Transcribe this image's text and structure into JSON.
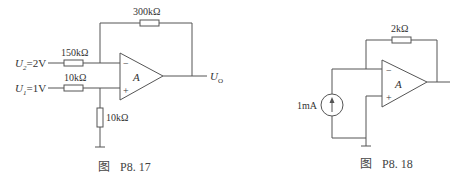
{
  "figures": [
    {
      "caption_prefix": "图",
      "caption_number": "P8. 17",
      "feedback_resistor": "300kΩ",
      "input2": {
        "label_main": "U",
        "label_sub": "2",
        "value": "=2V",
        "resistor": "150kΩ"
      },
      "input1": {
        "label_main": "U",
        "label_sub": "1",
        "value": "=1V",
        "resistor": "10kΩ"
      },
      "ground_resistor": "10kΩ",
      "opamp": {
        "label": "A",
        "minus": "−",
        "plus": "+"
      },
      "output": {
        "label_main": "U",
        "label_sub": "O"
      }
    },
    {
      "caption_prefix": "图",
      "caption_number": "P8. 18",
      "feedback_resistor": "2kΩ",
      "current_source": "1mA",
      "opamp": {
        "label": "A",
        "minus": "−",
        "plus": "+"
      }
    }
  ]
}
